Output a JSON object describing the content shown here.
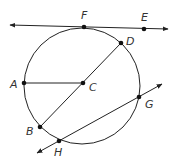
{
  "diagram": {
    "type": "circle-geometry",
    "stroke_color": "#222222",
    "label_color": "#333333",
    "circle": {
      "cx": 82,
      "cy": 86,
      "r": 58
    },
    "points": {
      "A": {
        "label": "A",
        "x": 24,
        "y": 83
      },
      "B": {
        "label": "B",
        "x": 40,
        "y": 127
      },
      "C": {
        "label": "C",
        "x": 83,
        "y": 83
      },
      "D": {
        "label": "D",
        "x": 121,
        "y": 43
      },
      "E": {
        "label": "E",
        "x": 144,
        "y": 29
      },
      "F": {
        "label": "F",
        "x": 84,
        "y": 27
      },
      "G": {
        "label": "G",
        "x": 139,
        "y": 97
      },
      "H": {
        "label": "H",
        "x": 59,
        "y": 141
      }
    },
    "segments": [
      {
        "name": "radius-CA",
        "from": "C",
        "to": "A"
      },
      {
        "name": "diameter-BD",
        "from": "B",
        "to": "D"
      }
    ],
    "lines": [
      {
        "name": "tangent-line-FE",
        "through": [
          "F",
          "E"
        ],
        "x1": 10,
        "y1": 25,
        "x2": 168,
        "y2": 29
      },
      {
        "name": "secant-line-HG",
        "through": [
          "H",
          "G"
        ],
        "x1": 37,
        "y1": 153,
        "x2": 162,
        "y2": 84
      }
    ]
  }
}
